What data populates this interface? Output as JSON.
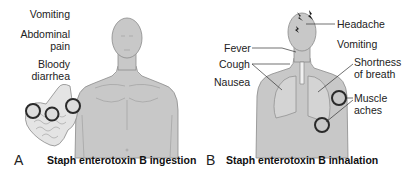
{
  "panels": [
    {
      "letter": "A",
      "caption": "Staph enterotoxin B ingestion",
      "symptoms": {
        "vomiting": "Vomiting",
        "abdominal_1": "Abdominal",
        "abdominal_2": "pain",
        "bloody_1": "Bloody",
        "bloody_2": "diarrhea"
      }
    },
    {
      "letter": "B",
      "caption": "Staph enterotoxin B inhalation",
      "symptoms": {
        "headache": "Headache",
        "fever": "Fever",
        "vomiting": "Vomiting",
        "cough": "Cough",
        "shortness_1": "Shortness",
        "shortness_2": "of breath",
        "nausea": "Nausea",
        "muscle_1": "Muscle",
        "muscle_2": "aches"
      }
    }
  ],
  "colors": {
    "body_fill": "#c8c8c8",
    "outline": "#8a8a8a",
    "circle": "#2a2a2a",
    "text": "#222222"
  }
}
